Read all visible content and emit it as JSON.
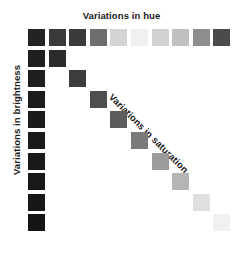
{
  "labels": {
    "hue": "Variations in hue",
    "brightness": "Variations in brightness",
    "saturation": "Variations in saturation"
  },
  "chart_data": {
    "type": "heatmap",
    "title": "Variations in hue",
    "xlabel": "Variations in hue",
    "ylabel": "Variations in brightness",
    "annotations": [
      "Variations in saturation"
    ],
    "grid": false,
    "legend": "none",
    "rows": 10,
    "cols": 10,
    "cell_size_px": 17,
    "cell_pitch_px": 20.6,
    "origin_px": [
      28,
      29
    ],
    "background": "#ffffff",
    "series": [
      {
        "name": "Variations in hue",
        "axis": "top-row",
        "row": 1,
        "cols": [
          1,
          2,
          3,
          4,
          5,
          6,
          7,
          8,
          9,
          10
        ],
        "values": [
          "#232323",
          "#3a3a3a",
          "#3b3b3b",
          "#6e6e6e",
          "#d4d4d4",
          "#efefef",
          "#d2d2d2",
          "#c0c0c0",
          "#8d8d8d",
          "#4b4b4b"
        ]
      },
      {
        "name": "Variations in brightness",
        "axis": "left-column",
        "col": 1,
        "rows": [
          1,
          2,
          3,
          4,
          5,
          6,
          7,
          8,
          9,
          10
        ],
        "values": [
          "#232323",
          "#1f1f1f",
          "#1e1e1e",
          "#1c1c1c",
          "#1b1b1b",
          "#1a1a1a",
          "#191919",
          "#181818",
          "#171717",
          "#151515"
        ]
      },
      {
        "name": "Variations in saturation",
        "axis": "diagonal",
        "cells": [
          2,
          3,
          4,
          5,
          6,
          7,
          8,
          9,
          10
        ],
        "values": [
          "#2b2b2b",
          "#3c3c3c",
          "#4e4e4e",
          "#5d5d5d",
          "#7a7a7a",
          "#9b9b9b",
          "#b5b5b5",
          "#e0e0e0",
          "#f1f1f1"
        ]
      }
    ]
  }
}
